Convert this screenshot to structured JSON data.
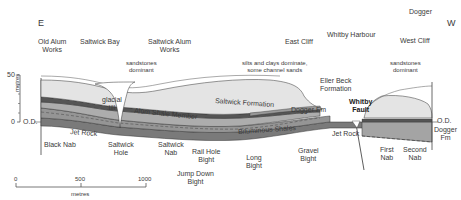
{
  "diagram": {
    "directions": {
      "east": "E",
      "west": "W"
    },
    "top_places": [
      {
        "id": "old-alum-works",
        "label1": "Old Alum",
        "label2": "Works"
      },
      {
        "id": "saltwick-bay",
        "label1": "Saltwick Bay",
        "label2": ""
      },
      {
        "id": "saltwick-alum-works",
        "label1": "Saltwick Alum",
        "label2": "Works"
      },
      {
        "id": "east-cliff",
        "label1": "East Cliff",
        "label2": ""
      },
      {
        "id": "whitby-harbour",
        "label1": "Whitby Harbour",
        "label2": ""
      },
      {
        "id": "west-cliff",
        "label1": "West Cliff",
        "label2": ""
      },
      {
        "id": "dogger-top",
        "label1": "Dogger",
        "label2": ""
      }
    ],
    "notes": [
      {
        "id": "sandstones-left",
        "label1": "sandstones",
        "label2": "dominant"
      },
      {
        "id": "silts-clays",
        "label1": "silts and clays dominate,",
        "label2": "some channel sands"
      },
      {
        "id": "sandstones-right",
        "label1": "sandstones",
        "label2": "dominant"
      }
    ],
    "units": {
      "glacial_till": [
        "glacial",
        "till"
      ],
      "saltwick_formation": "Saltwick Formation",
      "alum_shale_member": "Alum Shale Member",
      "dogger_fm": "Dogger Fm",
      "bituminous_shales": "Bituminous Shales",
      "jet_rock_left": "Jet Rock",
      "jet_rock_right": "Jet Rock",
      "eller_beck": [
        "Eller Beck",
        "Formation"
      ],
      "whitby_fault": [
        "Whitby",
        "Fault"
      ],
      "dogger_fm_right": [
        "Dogger",
        "Fm"
      ]
    },
    "bottom_places": [
      {
        "id": "black-nab",
        "label1": "Black Nab",
        "label2": ""
      },
      {
        "id": "saltwick-hole",
        "label1": "Saltwick",
        "label2": "Hole"
      },
      {
        "id": "saltwick-nab",
        "label1": "Saltwick",
        "label2": "Nab"
      },
      {
        "id": "rail-hole-bight",
        "label1": "Rail Hole",
        "label2": "Bight"
      },
      {
        "id": "jump-down-bight",
        "label1": "Jump Down",
        "label2": "Bight"
      },
      {
        "id": "long-bight",
        "label1": "Long",
        "label2": "Bight"
      },
      {
        "id": "gravel-bight",
        "label1": "Gravel",
        "label2": "Bight"
      },
      {
        "id": "first-nab",
        "label1": "First",
        "label2": "Nab"
      },
      {
        "id": "second-nab",
        "label1": "Second",
        "label2": "Nab"
      }
    ],
    "vertical_scale": {
      "label": "metres",
      "top": "50",
      "bottom": "0",
      "datum": "O.D.",
      "datum_right": "O.D."
    },
    "horizontal_scale": {
      "label": "metres",
      "ticks": [
        "0",
        "500",
        "1000"
      ]
    },
    "colors": {
      "till": "#ffffff",
      "saltwick": "#e2e2e2",
      "dogger": "#bdbdbd",
      "dark_band": "#555555",
      "alum": "#a8a8a8",
      "bituminous": "#8f8f8f",
      "jet": "#6a6a6a",
      "line": "#333333"
    }
  }
}
